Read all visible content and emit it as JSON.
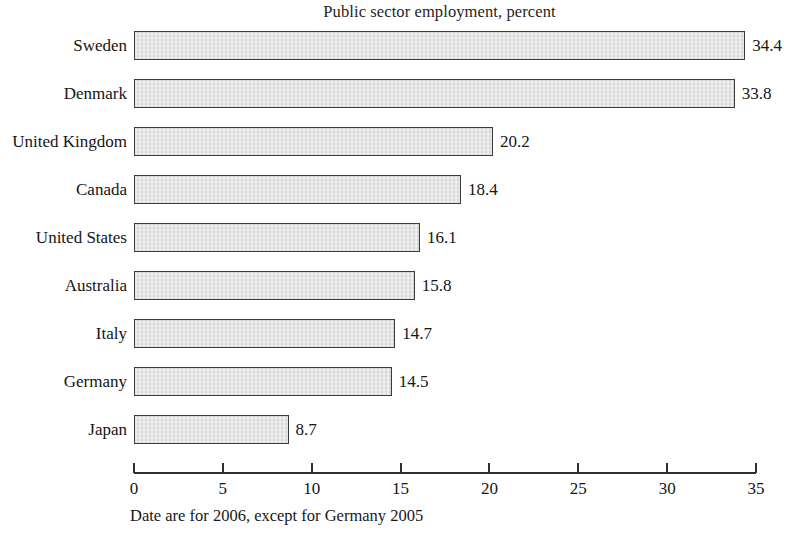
{
  "chart_data": {
    "type": "bar",
    "orientation": "horizontal",
    "title": "Public sector employment, percent",
    "subtitle": "",
    "xlabel": "",
    "ylabel": "",
    "categories": [
      "Sweden",
      "Denmark",
      "United Kingdom",
      "Canada",
      "United States",
      "Australia",
      "Italy",
      "Germany",
      "Japan"
    ],
    "values": [
      34.4,
      33.8,
      20.2,
      18.4,
      16.1,
      15.8,
      14.7,
      14.5,
      8.7
    ],
    "value_labels": [
      "34.4",
      "33.8",
      "20.2",
      "18.4",
      "16.1",
      "15.8",
      "14.7",
      "14.5",
      "8.7"
    ],
    "xlim": [
      0,
      35
    ],
    "xticks": [
      0,
      5,
      10,
      15,
      20,
      25,
      30,
      35
    ],
    "xtick_labels": [
      "0",
      "5",
      "10",
      "15",
      "20",
      "25",
      "30",
      "35"
    ],
    "grid": false,
    "legend": false,
    "legend_position": "none",
    "annotation": "Date are for 2006, except for Germany 2005",
    "bar_fill_color": "#dedede",
    "bar_border_color": "#3b3b3b",
    "axis_color": "#2f2f2f",
    "text_color": "#151515",
    "background_color": "#ffffff"
  }
}
